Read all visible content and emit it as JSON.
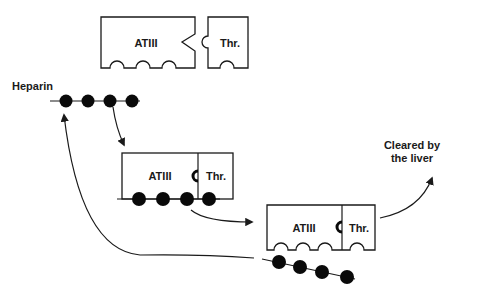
{
  "diagram": {
    "labels": {
      "heparin": "Heparin",
      "atiii": "ATIII",
      "thrombin": "Thr.",
      "cleared_line1": "Cleared by",
      "cleared_line2": "the liver"
    },
    "stages": [
      {
        "id": "free",
        "description": "Free ATIII and thrombin (separate pieces)"
      },
      {
        "id": "bound",
        "description": "Heparin bound to ATIII–thrombin complex"
      },
      {
        "id": "released",
        "description": "ATIII–thrombin complex released; heparin recycled"
      }
    ],
    "heparin_beads": 4,
    "arrows": [
      {
        "from": "heparin",
        "to": "bound-complex"
      },
      {
        "from": "bound-complex",
        "to": "released-complex"
      },
      {
        "from": "released-complex",
        "to": "liver-clearance"
      },
      {
        "from": "released-heparin",
        "to": "heparin"
      }
    ],
    "colors": {
      "ink": "#1a1a1a",
      "background": "#ffffff"
    }
  }
}
